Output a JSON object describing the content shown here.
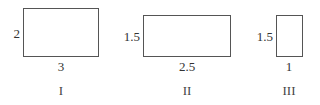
{
  "diagram": {
    "type": "rectangles",
    "colors": {
      "stroke": "#555555",
      "text": "#333333",
      "background": "#ffffff"
    },
    "figures": [
      {
        "name": "I",
        "width_label": "3",
        "height_label": "2",
        "width": 3,
        "height": 2
      },
      {
        "name": "II",
        "width_label": "2.5",
        "height_label": "1.5",
        "width": 2.5,
        "height": 1.5
      },
      {
        "name": "III",
        "width_label": "1",
        "height_label": "1.5",
        "width": 1,
        "height": 1.5
      }
    ]
  }
}
